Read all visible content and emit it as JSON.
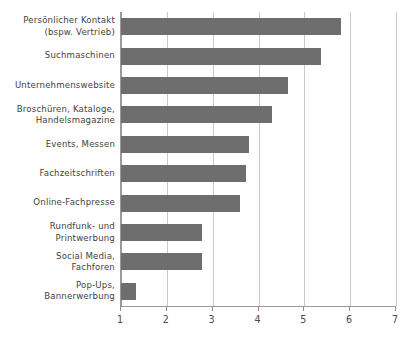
{
  "chart_data": {
    "type": "bar",
    "orientation": "horizontal",
    "title": "",
    "subtitle": "",
    "xlabel": "",
    "ylabel": "",
    "xlim": [
      1,
      7
    ],
    "xticks": [
      "1",
      "2",
      "3",
      "4",
      "5",
      "6",
      "7"
    ],
    "grid": true,
    "legend": false,
    "legend_position": "none",
    "bar_color": "#6e6e6e",
    "gridline_color": "#c9c9c9",
    "axis_color": "#9a9a9a",
    "background_color": "#ffffff",
    "categories": [
      "Persönlicher Kontakt\n(bspw. Vertrieb)",
      "Suchmaschinen",
      "Unternehmenswebsite",
      "Broschüren, Kataloge,\nHandelsmagazine",
      "Events, Messen",
      "Fachzeitschriften",
      "Online-Fachpresse",
      "Rundfunk- und\nPrintwerbung",
      "Social Media,\nFachforen",
      "Pop-Ups,\nBannerwerbung"
    ],
    "values": [
      5.8,
      5.37,
      4.65,
      4.3,
      3.8,
      3.72,
      3.6,
      2.77,
      2.77,
      1.33
    ]
  }
}
